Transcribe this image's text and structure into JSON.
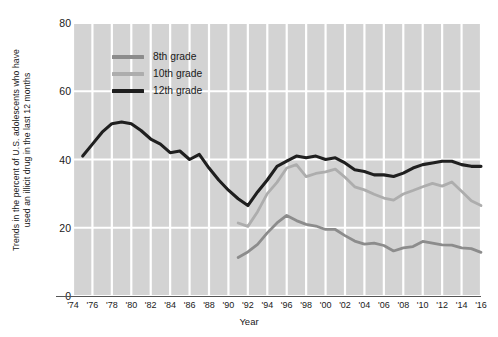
{
  "chart_data": {
    "type": "line",
    "title": "",
    "xlabel": "Year",
    "ylabel_line1": "Trends in the percent of U.S. adolescents  who have",
    "ylabel_line2": "used an illicit drug in the last 12 months",
    "ylim": [
      0,
      80
    ],
    "yticks": [
      0,
      20,
      40,
      60,
      80
    ],
    "xlim": [
      1974,
      2016
    ],
    "xticks": [
      1974,
      1976,
      1978,
      1980,
      1982,
      1984,
      1986,
      1988,
      1990,
      1992,
      1994,
      1996,
      1998,
      2000,
      2002,
      2004,
      2006,
      2008,
      2010,
      2012,
      2014,
      2016
    ],
    "xtick_labels": [
      "'74",
      "'76",
      "'78",
      "'80",
      "'82",
      "'84",
      "'86",
      "'88",
      "'90",
      "'92",
      "'94",
      "'96",
      "'98",
      "'00",
      "'02",
      "'04",
      "'06",
      "'08",
      "'10",
      "'12",
      "'14",
      "'16"
    ],
    "grid": true,
    "grid_color": "#ffffff",
    "plot_background": "#d3d3d3",
    "legend_position": "upper-left-inside",
    "series": [
      {
        "name": "8th grade",
        "color": "#8c8c8c",
        "x": [
          1991,
          1992,
          1993,
          1994,
          1995,
          1996,
          1997,
          1998,
          1999,
          2000,
          2001,
          2002,
          2003,
          2004,
          2005,
          2006,
          2007,
          2008,
          2009,
          2010,
          2011,
          2012,
          2013,
          2014,
          2015,
          2016
        ],
        "values": [
          11.3,
          12.9,
          15.1,
          18.5,
          21.4,
          23.6,
          22.1,
          21.0,
          20.5,
          19.5,
          19.5,
          17.7,
          16.1,
          15.2,
          15.5,
          14.8,
          13.2,
          14.1,
          14.5,
          16.0,
          15.5,
          15.0,
          14.9,
          14.1,
          13.9,
          12.8
        ]
      },
      {
        "name": "10th grade",
        "color": "#adadad",
        "x": [
          1991,
          1992,
          1993,
          1994,
          1995,
          1996,
          1997,
          1998,
          1999,
          2000,
          2001,
          2002,
          2003,
          2004,
          2005,
          2006,
          2007,
          2008,
          2009,
          2010,
          2011,
          2012,
          2013,
          2014,
          2015,
          2016
        ],
        "values": [
          21.4,
          20.4,
          24.7,
          30.0,
          33.3,
          37.5,
          38.5,
          35.0,
          35.9,
          36.4,
          37.2,
          34.8,
          32.0,
          31.1,
          29.8,
          28.7,
          28.1,
          29.9,
          30.9,
          32.0,
          33.0,
          32.2,
          33.4,
          30.7,
          27.9,
          26.5
        ]
      },
      {
        "name": "12th grade",
        "color": "#1f1f1f",
        "x": [
          1975,
          1976,
          1977,
          1978,
          1979,
          1980,
          1981,
          1982,
          1983,
          1984,
          1985,
          1986,
          1987,
          1988,
          1989,
          1990,
          1991,
          1992,
          1993,
          1994,
          1995,
          1996,
          1997,
          1998,
          1999,
          2000,
          2001,
          2002,
          2003,
          2004,
          2005,
          2006,
          2007,
          2008,
          2009,
          2010,
          2011,
          2012,
          2013,
          2014,
          2015,
          2016
        ],
        "values": [
          41.0,
          44.5,
          48.0,
          50.5,
          51.0,
          50.5,
          48.5,
          46.0,
          44.5,
          42.0,
          42.5,
          40.0,
          41.5,
          37.5,
          34.0,
          31.0,
          28.5,
          26.5,
          30.5,
          34.0,
          38.0,
          39.5,
          41.0,
          40.5,
          41.0,
          40.0,
          40.5,
          39.0,
          37.0,
          36.5,
          35.5,
          35.5,
          35.0,
          36.0,
          37.5,
          38.5,
          39.0,
          39.5,
          39.5,
          38.5,
          38.0,
          38.0
        ]
      }
    ]
  },
  "legend": {
    "items": [
      {
        "label": "8th grade",
        "color": "#8c8c8c"
      },
      {
        "label": "10th grade",
        "color": "#adadad"
      },
      {
        "label": "12th grade",
        "color": "#1f1f1f"
      }
    ]
  },
  "axes": {
    "x_title": "Year",
    "y_title_line1": "Trends in the percent of U.S. adolescents  who have",
    "y_title_line2": "used an illicit drug in the last 12 months"
  }
}
